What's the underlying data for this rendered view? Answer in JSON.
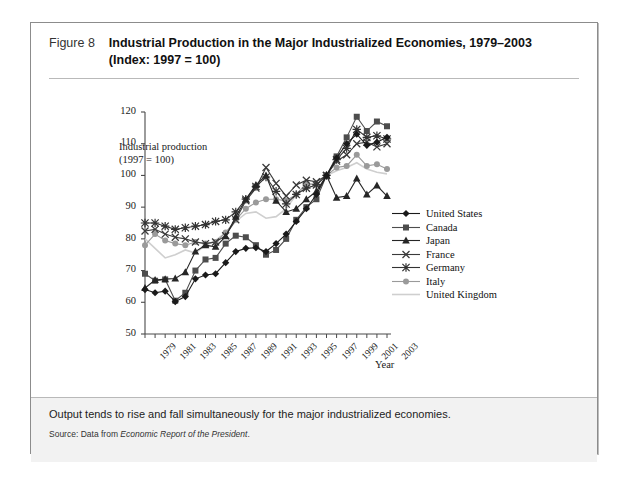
{
  "figure": {
    "label": "Figure 8",
    "title_line1": "Industrial Production in the Major Industrialized Economies, 1979–2003",
    "title_line2": "(Index: 1997 = 100)",
    "note": "Output tends to rise and fall simultaneously for the major industrialized economies.",
    "source_prefix": "Source: Data from ",
    "source_italic": "Economic Report of the President",
    "source_suffix": "."
  },
  "chart_data": {
    "type": "line",
    "title": "Industrial Production in the Major Industrialized Economies, 1979–2003",
    "ylabel_line1": "Industrial production",
    "ylabel_line2": "(1997 = 100)",
    "xlabel": "Year",
    "ylim": [
      50,
      120
    ],
    "ytick_step": 10,
    "yticks": [
      50,
      60,
      70,
      80,
      90,
      100,
      110,
      120
    ],
    "xlim": [
      1979,
      2003
    ],
    "x": [
      1979,
      1980,
      1981,
      1982,
      1983,
      1984,
      1985,
      1986,
      1987,
      1988,
      1989,
      1990,
      1991,
      1992,
      1993,
      1994,
      1995,
      1996,
      1997,
      1998,
      1999,
      2000,
      2001,
      2002,
      2003
    ],
    "xticks_labeled": [
      1979,
      1981,
      1983,
      1985,
      1987,
      1989,
      1991,
      1993,
      1995,
      1997,
      1999,
      2001,
      2003
    ],
    "grid": false,
    "legend_position": "right-middle",
    "series": [
      {
        "name": "United States",
        "color": "#1a1a1a",
        "marker": "diamond",
        "values": [
          64.0,
          63.0,
          63.5,
          60.2,
          61.8,
          67.4,
          68.6,
          69.0,
          72.5,
          76.0,
          77.0,
          77.2,
          76.0,
          78.5,
          81.5,
          85.5,
          89.5,
          94.0,
          100.0,
          105.5,
          110.0,
          113.0,
          109.5,
          110.5,
          112.0
        ]
      },
      {
        "name": "Canada",
        "color": "#4d4d4d",
        "marker": "square",
        "values": [
          69.0,
          66.8,
          67.2,
          60.5,
          63.0,
          70.0,
          73.5,
          74.0,
          78.5,
          81.0,
          80.5,
          78.0,
          75.0,
          76.5,
          80.0,
          86.0,
          90.0,
          92.5,
          100.0,
          106.0,
          112.0,
          118.5,
          114.0,
          117.0,
          115.5
        ]
      },
      {
        "name": "Japan",
        "color": "#262626",
        "marker": "triangle",
        "values": [
          64.5,
          67.0,
          67.3,
          67.5,
          69.5,
          76.0,
          78.0,
          77.5,
          80.8,
          87.0,
          92.5,
          97.0,
          100.0,
          92.0,
          88.5,
          89.5,
          92.5,
          95.0,
          100.0,
          93.0,
          93.5,
          99.0,
          94.0,
          96.8,
          93.5
        ]
      },
      {
        "name": "France",
        "color": "#3a3a3a",
        "marker": "cross",
        "values": [
          82.5,
          83.0,
          81.5,
          80.5,
          80.0,
          79.0,
          78.5,
          79.0,
          81.0,
          86.0,
          92.0,
          96.0,
          102.5,
          97.5,
          93.5,
          97.0,
          98.5,
          98.0,
          100.0,
          104.5,
          106.5,
          110.0,
          110.5,
          109.0,
          110.0
        ]
      },
      {
        "name": "Germany",
        "color": "#333333",
        "marker": "star",
        "values": [
          85.0,
          85.0,
          84.0,
          83.0,
          83.5,
          84.0,
          84.5,
          85.5,
          86.0,
          88.5,
          92.5,
          96.5,
          99.5,
          95.0,
          91.0,
          94.0,
          96.0,
          97.0,
          100.0,
          105.0,
          108.5,
          114.5,
          112.0,
          112.5,
          111.5
        ]
      },
      {
        "name": "Italy",
        "color": "#9a9a9a",
        "marker": "circle",
        "values": [
          78.0,
          81.5,
          79.5,
          78.5,
          78.0,
          79.0,
          78.5,
          79.0,
          82.0,
          86.0,
          89.5,
          91.5,
          92.5,
          92.5,
          92.0,
          94.0,
          97.5,
          97.0,
          100.0,
          102.5,
          103.0,
          106.5,
          103.0,
          103.5,
          102.0
        ]
      },
      {
        "name": "United Kingdom",
        "color": "#cfcfcf",
        "marker": "none",
        "values": [
          80.0,
          77.0,
          74.0,
          75.0,
          76.5,
          75.5,
          78.0,
          79.5,
          82.0,
          85.5,
          88.0,
          88.5,
          86.5,
          87.0,
          89.5,
          94.0,
          96.5,
          98.0,
          100.0,
          101.5,
          102.5,
          104.0,
          102.0,
          101.0,
          100.5
        ]
      }
    ]
  }
}
